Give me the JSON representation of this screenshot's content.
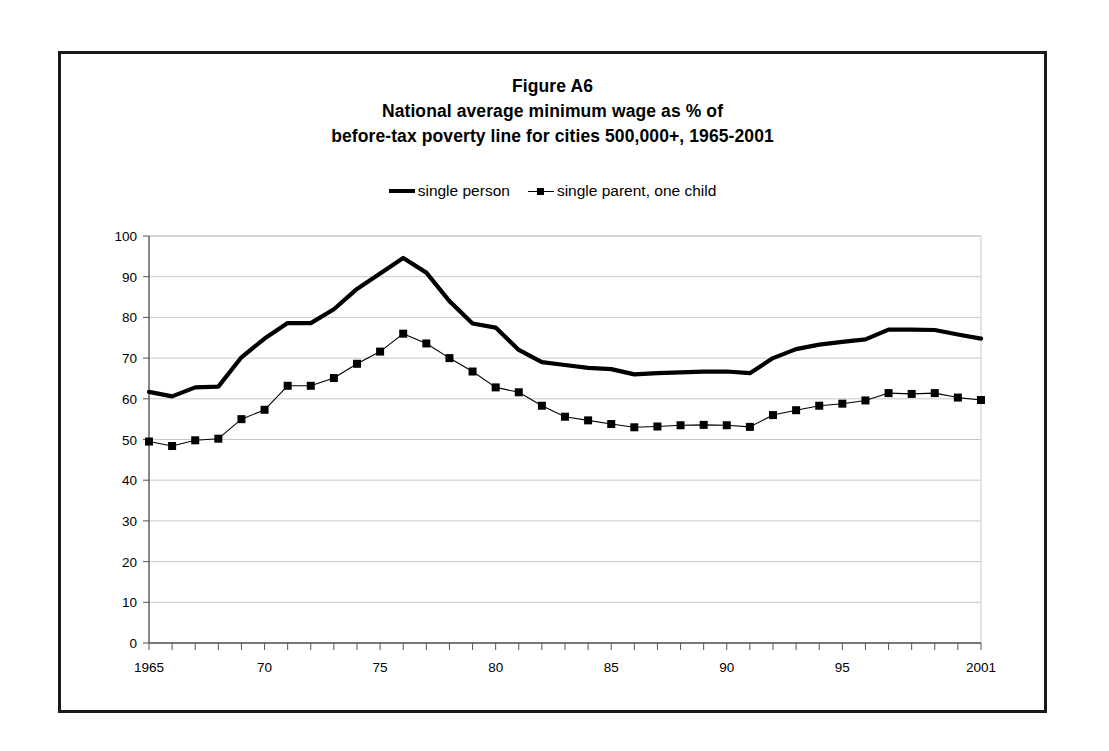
{
  "figure": {
    "title_lines": [
      "Figure A6",
      "National average minimum wage as % of",
      "before-tax poverty line for cities 500,000+, 1965-2001"
    ]
  },
  "legend": {
    "position": "top-center",
    "entries": [
      {
        "label": "single person",
        "style": "thick-line",
        "marker": "none",
        "color": "#000000"
      },
      {
        "label": "single parent, one child",
        "style": "thin-line",
        "marker": "square",
        "color": "#000000"
      }
    ]
  },
  "chart_data": {
    "type": "line",
    "xlabel": "",
    "ylabel": "",
    "xlim": [
      1965,
      2001
    ],
    "ylim": [
      0,
      100
    ],
    "grid": true,
    "y_ticks": [
      0,
      10,
      20,
      30,
      40,
      50,
      60,
      70,
      80,
      90,
      100
    ],
    "y_tick_labels": [
      "0",
      "10",
      "20",
      "30",
      "40",
      "50",
      "60",
      "70",
      "80",
      "90",
      "100"
    ],
    "x": [
      1965,
      1966,
      1967,
      1968,
      1969,
      1970,
      1971,
      1972,
      1973,
      1974,
      1975,
      1976,
      1977,
      1978,
      1979,
      1980,
      1981,
      1982,
      1983,
      1984,
      1985,
      1986,
      1987,
      1988,
      1989,
      1990,
      1991,
      1992,
      1993,
      1994,
      1995,
      1996,
      1997,
      1998,
      1999,
      2000,
      2001
    ],
    "x_tick_labels": {
      "1965": "1965",
      "1970": "70",
      "1975": "75",
      "1980": "80",
      "1985": "85",
      "1990": "90",
      "1995": "95",
      "2001": "2001"
    },
    "series": [
      {
        "name": "single person",
        "style": "thick-line",
        "marker": "none",
        "color": "#000000",
        "values": [
          61.7,
          60.6,
          62.8,
          63.0,
          70.2,
          74.8,
          78.6,
          78.6,
          82.0,
          87.0,
          90.8,
          94.6,
          91.0,
          84.0,
          78.5,
          77.5,
          72.0,
          69.0,
          68.3,
          67.6,
          67.3,
          66.0,
          66.3,
          66.5,
          66.7,
          66.7,
          66.3,
          70.0,
          72.2,
          73.3,
          74.0,
          74.6,
          77.0,
          77.0,
          76.9,
          75.8,
          74.8
        ]
      },
      {
        "name": "single parent, one child",
        "style": "thin-line",
        "marker": "square",
        "color": "#000000",
        "values": [
          49.5,
          48.4,
          49.8,
          50.2,
          55.0,
          57.3,
          63.2,
          63.2,
          65.1,
          68.6,
          71.6,
          76.0,
          73.6,
          70.0,
          66.7,
          62.8,
          61.6,
          58.3,
          55.6,
          54.7,
          53.8,
          53.0,
          53.2,
          53.5,
          53.6,
          53.5,
          53.1,
          56.0,
          57.2,
          58.3,
          58.8,
          59.6,
          61.4,
          61.2,
          61.4,
          60.3,
          59.7
        ]
      }
    ]
  }
}
